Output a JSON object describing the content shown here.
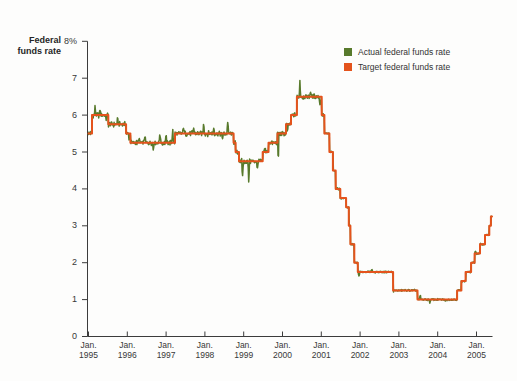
{
  "title": {
    "line1": "Federal",
    "line2": "funds rate"
  },
  "legend": [
    {
      "label": "Actual federal funds rate",
      "color": "#587a2c"
    },
    {
      "label": "Target federal funds rate",
      "color": "#e4531c"
    }
  ],
  "chart_data": {
    "type": "line",
    "title": "Federal funds rate",
    "xlabel": "",
    "ylabel": "Federal funds rate (%)",
    "xlim": [
      1995.0,
      2005.45
    ],
    "ylim": [
      0,
      8
    ],
    "grid": false,
    "legend_position": "top-right",
    "axis_color": "#3c3c3c",
    "t_end": 2005.4,
    "y_ticks": [
      {
        "value": 0,
        "label": "0"
      },
      {
        "value": 1,
        "label": "1"
      },
      {
        "value": 2,
        "label": "2"
      },
      {
        "value": 3,
        "label": "3"
      },
      {
        "value": 4,
        "label": "4"
      },
      {
        "value": 5,
        "label": "5"
      },
      {
        "value": 6,
        "label": "6"
      },
      {
        "value": 7,
        "label": "7"
      },
      {
        "value": 8,
        "label": "8%"
      }
    ],
    "x_ticks": [
      {
        "t": 1995,
        "line1": "Jan.",
        "line2": "1995"
      },
      {
        "t": 1996,
        "line1": "Jan.",
        "line2": "1996"
      },
      {
        "t": 1997,
        "line1": "Jan.",
        "line2": "1997"
      },
      {
        "t": 1998,
        "line1": "Jan.",
        "line2": "1998"
      },
      {
        "t": 1999,
        "line1": "Jan.",
        "line2": "1999"
      },
      {
        "t": 2000,
        "line1": "Jan.",
        "line2": "2000"
      },
      {
        "t": 2001,
        "line1": "Jan.",
        "line2": "2001"
      },
      {
        "t": 2002,
        "line1": "Jan.",
        "line2": "2002"
      },
      {
        "t": 2003,
        "line1": "Jan.",
        "line2": "2003"
      },
      {
        "t": 2004,
        "line1": "Jan.",
        "line2": "2004"
      },
      {
        "t": 2005,
        "line1": "Jan.",
        "line2": "2005"
      }
    ],
    "series": [
      {
        "name": "Actual federal funds rate",
        "color": "#587a2c",
        "role": "actual",
        "derivation": "target plus daily deviation noise",
        "noise": {
          "amp_hi": 0.085,
          "amp_lo": 0.03,
          "amp_switch_t": 2001.06,
          "spikes": [
            [
              1995.17,
              0.22
            ],
            [
              1995.3,
              0.15
            ],
            [
              1995.45,
              -0.15
            ],
            [
              1995.75,
              0.15
            ],
            [
              1996.05,
              -0.2
            ],
            [
              1996.3,
              0.15
            ],
            [
              1996.45,
              0.22
            ],
            [
              1996.67,
              -0.2
            ],
            [
              1996.84,
              0.3
            ],
            [
              1997.0,
              0.2
            ],
            [
              1997.17,
              0.42
            ],
            [
              1997.45,
              0.22
            ],
            [
              1997.71,
              0.18
            ],
            [
              1997.97,
              0.3
            ],
            [
              1998.23,
              0.18
            ],
            [
              1998.45,
              -0.15
            ],
            [
              1998.59,
              0.36
            ],
            [
              1998.97,
              -0.45
            ],
            [
              1999.13,
              -0.6
            ],
            [
              1999.35,
              -0.25
            ],
            [
              1999.55,
              0.15
            ],
            [
              1999.89,
              -0.95,
              0.016
            ],
            [
              2000.13,
              -0.22
            ],
            [
              2000.45,
              0.5,
              0.018
            ],
            [
              2000.72,
              0.18
            ],
            [
              2000.97,
              -0.3
            ],
            [
              2001.97,
              -0.12
            ],
            [
              2002.3,
              0.08
            ],
            [
              2002.85,
              -0.1
            ],
            [
              2003.55,
              0.13
            ],
            [
              2003.8,
              -0.1
            ],
            [
              2004.2,
              -0.06
            ],
            [
              2004.97,
              0.08
            ]
          ]
        }
      },
      {
        "name": "Target federal funds rate",
        "color": "#e4531c",
        "role": "target",
        "steps": [
          [
            1995.0,
            5.5
          ],
          [
            1995.09,
            6.0
          ],
          [
            1995.51,
            5.75
          ],
          [
            1995.97,
            5.5
          ],
          [
            1996.08,
            5.25
          ],
          [
            1997.23,
            5.5
          ],
          [
            1998.74,
            5.25
          ],
          [
            1998.79,
            5.0
          ],
          [
            1998.88,
            4.75
          ],
          [
            1999.49,
            5.0
          ],
          [
            1999.64,
            5.25
          ],
          [
            1999.87,
            5.5
          ],
          [
            2000.09,
            5.75
          ],
          [
            2000.22,
            6.0
          ],
          [
            2000.37,
            6.5
          ],
          [
            2001.01,
            6.0
          ],
          [
            2001.08,
            5.5
          ],
          [
            2001.21,
            5.0
          ],
          [
            2001.3,
            4.5
          ],
          [
            2001.37,
            4.0
          ],
          [
            2001.49,
            3.75
          ],
          [
            2001.64,
            3.5
          ],
          [
            2001.71,
            3.0
          ],
          [
            2001.75,
            2.5
          ],
          [
            2001.85,
            2.0
          ],
          [
            2001.94,
            1.75
          ],
          [
            2002.85,
            1.25
          ],
          [
            2003.48,
            1.0
          ],
          [
            2004.5,
            1.25
          ],
          [
            2004.61,
            1.5
          ],
          [
            2004.72,
            1.75
          ],
          [
            2004.86,
            2.0
          ],
          [
            2004.95,
            2.25
          ],
          [
            2005.09,
            2.5
          ],
          [
            2005.22,
            2.75
          ],
          [
            2005.33,
            3.0
          ],
          [
            2005.37,
            3.25
          ]
        ]
      }
    ]
  }
}
